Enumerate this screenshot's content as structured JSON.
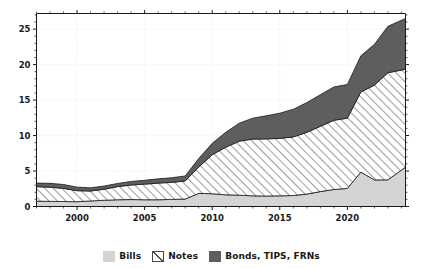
{
  "chart_data": {
    "type": "area",
    "stacked": true,
    "title": "",
    "subtitle": "",
    "xlabel": "",
    "ylabel": "",
    "xlim": [
      1997,
      2024.3
    ],
    "ylim": [
      0,
      27.2
    ],
    "grid": "dotted-faint",
    "legend_position": "bottom-center",
    "x": [
      1997,
      1998,
      1999,
      2000,
      2001,
      2002,
      2003,
      2004,
      2005,
      2006,
      2007,
      2008,
      2009,
      2010,
      2011,
      2012,
      2013,
      2014,
      2015,
      2016,
      2017,
      2018,
      2019,
      2020,
      2021,
      2022,
      2023,
      2024.3
    ],
    "yticks": [
      0,
      5,
      10,
      15,
      20,
      25
    ],
    "ytick_labels": [
      "0",
      "5",
      "10",
      "15",
      "20",
      "25"
    ],
    "xticks_major": [
      2000,
      2005,
      2010,
      2015,
      2020
    ],
    "xtick_labels": [
      "2000",
      "2005",
      "2010",
      "2015",
      "2020"
    ],
    "series": [
      {
        "name": "Bills",
        "color": "#d4d4d4",
        "pattern": "solid",
        "values": [
          0.75,
          0.72,
          0.7,
          0.68,
          0.78,
          0.88,
          0.95,
          0.98,
          0.95,
          0.95,
          1.0,
          1.05,
          1.85,
          1.8,
          1.65,
          1.6,
          1.5,
          1.48,
          1.5,
          1.55,
          1.75,
          2.1,
          2.4,
          2.55,
          4.85,
          3.75,
          3.75,
          5.55
        ]
      },
      {
        "name": "Notes",
        "color": "#ffffff",
        "pattern": "diagonal-hatch",
        "values": [
          2.05,
          2.0,
          1.85,
          1.55,
          1.4,
          1.55,
          1.85,
          2.05,
          2.2,
          2.35,
          2.4,
          2.55,
          3.7,
          5.5,
          6.7,
          7.6,
          8.0,
          8.05,
          8.1,
          8.25,
          8.7,
          9.2,
          9.75,
          9.9,
          11.3,
          13.35,
          15.1,
          13.8
        ]
      },
      {
        "name": "Bonds, TIPS, FRNs",
        "color": "#5e5e5e",
        "pattern": "solid",
        "values": [
          0.5,
          0.55,
          0.55,
          0.5,
          0.45,
          0.45,
          0.45,
          0.5,
          0.55,
          0.6,
          0.65,
          0.7,
          1.2,
          1.6,
          2.1,
          2.55,
          2.95,
          3.25,
          3.55,
          3.9,
          4.2,
          4.45,
          4.7,
          4.75,
          5.1,
          5.75,
          6.55,
          7.15
        ]
      }
    ],
    "series_totals": [
      3.3,
      3.27,
      3.1,
      2.73,
      2.63,
      2.88,
      3.25,
      3.53,
      3.7,
      3.9,
      4.05,
      4.3,
      6.75,
      8.9,
      10.45,
      11.75,
      12.45,
      12.78,
      13.15,
      13.7,
      14.65,
      15.75,
      16.85,
      17.2,
      21.25,
      22.85,
      25.4,
      26.5
    ]
  },
  "legend": {
    "entries": [
      {
        "label": "Bills",
        "swatch": "solid-light-gray-swatch"
      },
      {
        "label": "Notes",
        "swatch": "diagonal-hatch-swatch"
      },
      {
        "label": "Bonds, TIPS, FRNs",
        "swatch": "solid-dark-gray-swatch"
      }
    ]
  },
  "colors": {
    "bills": "#d4d4d4",
    "notes_fill": "#ffffff",
    "notes_hatch": "#4a4a4a",
    "bonds": "#5e5e5e",
    "axis": "#1a1a1a",
    "grid": "#e8e8e8",
    "background": "#ffffff"
  }
}
